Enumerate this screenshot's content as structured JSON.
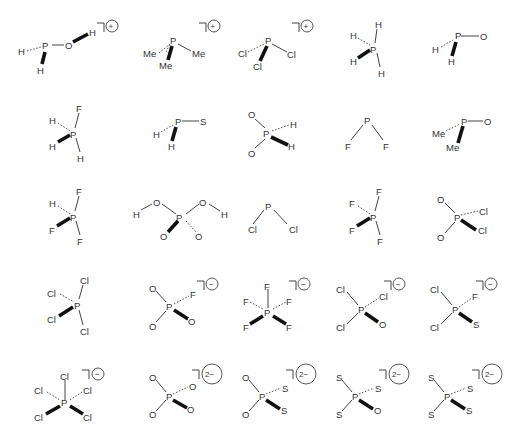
{
  "figure": {
    "type": "chemical-structure-grid",
    "rows": 5,
    "columns": 5,
    "molecules": [
      {
        "id": "m1",
        "center": "P",
        "charge": "+",
        "charge_symbol": "⊕",
        "atoms": [
          {
            "label": "H",
            "bond": "dash"
          },
          {
            "label": "O",
            "bond": "single"
          },
          {
            "label": "H",
            "bond": "wedge"
          }
        ],
        "extra": {
          "O_H": "wedge"
        }
      },
      {
        "id": "m2",
        "center": "P",
        "charge": "+",
        "charge_symbol": "⊕",
        "atoms": [
          {
            "label": "Me",
            "bond": "dash"
          },
          {
            "label": "Me",
            "bond": "wedge"
          },
          {
            "label": "Me",
            "bond": "single"
          }
        ]
      },
      {
        "id": "m3",
        "center": "P",
        "charge": "+",
        "charge_symbol": "⊕",
        "atoms": [
          {
            "label": "Cl",
            "bond": "dash"
          },
          {
            "label": "Cl",
            "bond": "wedge"
          },
          {
            "label": "Cl",
            "bond": "single"
          }
        ]
      },
      {
        "id": "m4",
        "center": "P",
        "charge": "",
        "atoms": [
          {
            "label": "H",
            "bond": "single"
          },
          {
            "label": "H",
            "bond": "dash"
          },
          {
            "label": "H",
            "bond": "wedge"
          },
          {
            "label": "H",
            "bond": "single"
          }
        ]
      },
      {
        "id": "m5",
        "center": "P",
        "charge": "",
        "atoms": [
          {
            "label": "H",
            "bond": "dash"
          },
          {
            "label": "H",
            "bond": "wedge"
          },
          {
            "label": "O",
            "bond": "single"
          }
        ]
      },
      {
        "id": "m6",
        "center": "P",
        "charge": "",
        "atoms": [
          {
            "label": "F",
            "bond": "single"
          },
          {
            "label": "H",
            "bond": "dash"
          },
          {
            "label": "H",
            "bond": "wedge"
          },
          {
            "label": "H",
            "bond": "single"
          }
        ]
      },
      {
        "id": "m7",
        "center": "P",
        "charge": "",
        "atoms": [
          {
            "label": "H",
            "bond": "dash"
          },
          {
            "label": "H",
            "bond": "wedge"
          },
          {
            "label": "S",
            "bond": "single"
          }
        ]
      },
      {
        "id": "m8",
        "center": "P",
        "charge": "",
        "atoms": [
          {
            "label": "O",
            "bond": "single"
          },
          {
            "label": "O",
            "bond": "single"
          },
          {
            "label": "H",
            "bond": "dash"
          },
          {
            "label": "H",
            "bond": "wedge"
          }
        ]
      },
      {
        "id": "m9",
        "center": "P",
        "charge": "",
        "atoms": [
          {
            "label": "F",
            "bond": "single"
          },
          {
            "label": "F",
            "bond": "single"
          }
        ]
      },
      {
        "id": "m10",
        "center": "P",
        "charge": "",
        "atoms": [
          {
            "label": "Me",
            "bond": "dash"
          },
          {
            "label": "Me",
            "bond": "wedge"
          },
          {
            "label": "O",
            "bond": "single"
          }
        ]
      },
      {
        "id": "m11",
        "center": "P",
        "charge": "",
        "atoms": [
          {
            "label": "F",
            "bond": "single"
          },
          {
            "label": "H",
            "bond": "dash"
          },
          {
            "label": "F",
            "bond": "wedge"
          },
          {
            "label": "F",
            "bond": "single"
          }
        ]
      },
      {
        "id": "m12",
        "center": "P",
        "charge": "",
        "atoms": [
          {
            "label": "O",
            "bond": "single"
          },
          {
            "label": "O",
            "bond": "single"
          },
          {
            "label": "O",
            "bond": "wedge"
          },
          {
            "label": "O",
            "bond": "dash"
          }
        ],
        "extra": {
          "H_left": "H",
          "H_right": "H"
        }
      },
      {
        "id": "m13",
        "center": "P",
        "charge": "",
        "atoms": [
          {
            "label": "Cl",
            "bond": "single"
          },
          {
            "label": "Cl",
            "bond": "single"
          }
        ]
      },
      {
        "id": "m14",
        "center": "P",
        "charge": "",
        "atoms": [
          {
            "label": "F",
            "bond": "single"
          },
          {
            "label": "F",
            "bond": "dash"
          },
          {
            "label": "F",
            "bond": "wedge"
          },
          {
            "label": "F",
            "bond": "single"
          }
        ]
      },
      {
        "id": "m15",
        "center": "P",
        "charge": "",
        "atoms": [
          {
            "label": "O",
            "bond": "single"
          },
          {
            "label": "O",
            "bond": "single"
          },
          {
            "label": "Cl",
            "bond": "dash"
          },
          {
            "label": "Cl",
            "bond": "wedge"
          }
        ]
      },
      {
        "id": "m16",
        "center": "P",
        "charge": "",
        "atoms": [
          {
            "label": "Cl",
            "bond": "single"
          },
          {
            "label": "Cl",
            "bond": "dash"
          },
          {
            "label": "Cl",
            "bond": "wedge"
          },
          {
            "label": "Cl",
            "bond": "single"
          }
        ]
      },
      {
        "id": "m17",
        "center": "P",
        "charge": "−",
        "charge_symbol": "⊖",
        "atoms": [
          {
            "label": "O",
            "bond": "single"
          },
          {
            "label": "O",
            "bond": "single"
          },
          {
            "label": "F",
            "bond": "dash"
          },
          {
            "label": "O",
            "bond": "wedge"
          }
        ]
      },
      {
        "id": "m18",
        "center": "P",
        "charge": "−",
        "charge_symbol": "⊖",
        "atoms": [
          {
            "label": "F",
            "bond": "single"
          },
          {
            "label": "F",
            "bond": "dash"
          },
          {
            "label": "F",
            "bond": "dash"
          },
          {
            "label": "F",
            "bond": "wedge"
          },
          {
            "label": "F",
            "bond": "wedge"
          }
        ]
      },
      {
        "id": "m19",
        "center": "P",
        "charge": "−",
        "charge_symbol": "⊖",
        "atoms": [
          {
            "label": "Cl",
            "bond": "single"
          },
          {
            "label": "Cl",
            "bond": "single"
          },
          {
            "label": "Cl",
            "bond": "dash"
          },
          {
            "label": "O",
            "bond": "wedge"
          }
        ]
      },
      {
        "id": "m20",
        "center": "P",
        "charge": "−",
        "charge_symbol": "⊖",
        "atoms": [
          {
            "label": "Cl",
            "bond": "single"
          },
          {
            "label": "Cl",
            "bond": "single"
          },
          {
            "label": "F",
            "bond": "dash"
          },
          {
            "label": "S",
            "bond": "wedge"
          }
        ]
      },
      {
        "id": "m21",
        "center": "P",
        "charge": "−",
        "charge_symbol": "⊖",
        "atoms": [
          {
            "label": "Cl",
            "bond": "single"
          },
          {
            "label": "Cl",
            "bond": "dash"
          },
          {
            "label": "Cl",
            "bond": "dash"
          },
          {
            "label": "Cl",
            "bond": "wedge"
          },
          {
            "label": "Cl",
            "bond": "wedge"
          }
        ]
      },
      {
        "id": "m22",
        "center": "P",
        "charge": "2−",
        "atoms": [
          {
            "label": "O",
            "bond": "single"
          },
          {
            "label": "O",
            "bond": "single"
          },
          {
            "label": "O",
            "bond": "dash"
          },
          {
            "label": "O",
            "bond": "wedge"
          }
        ]
      },
      {
        "id": "m23",
        "center": "P",
        "charge": "2−",
        "atoms": [
          {
            "label": "O",
            "bond": "single"
          },
          {
            "label": "O",
            "bond": "single"
          },
          {
            "label": "S",
            "bond": "dash"
          },
          {
            "label": "S",
            "bond": "wedge"
          }
        ]
      },
      {
        "id": "m24",
        "center": "P",
        "charge": "2−",
        "atoms": [
          {
            "label": "S",
            "bond": "single"
          },
          {
            "label": "S",
            "bond": "single"
          },
          {
            "label": "S",
            "bond": "dash"
          },
          {
            "label": "O",
            "bond": "wedge"
          }
        ]
      },
      {
        "id": "m25",
        "center": "P",
        "charge": "2−",
        "atoms": [
          {
            "label": "S",
            "bond": "single"
          },
          {
            "label": "S",
            "bond": "single"
          },
          {
            "label": "S",
            "bond": "dash"
          },
          {
            "label": "S",
            "bond": "wedge"
          }
        ]
      }
    ]
  },
  "labels": {
    "P": "P",
    "H": "H",
    "O": "O",
    "S": "S",
    "F": "F",
    "Cl": "Cl",
    "Me": "Me",
    "plus": "+",
    "minus": "−",
    "two_minus": "2−"
  }
}
